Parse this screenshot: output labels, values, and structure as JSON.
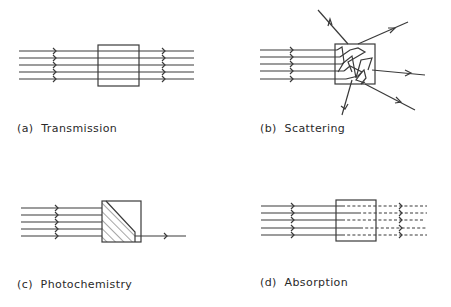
{
  "figure": {
    "panels": [
      {
        "id": "a",
        "label": "(a)  Transmission",
        "process": "Transmission",
        "rays_in": 5,
        "rays_out": 5,
        "output": "solid"
      },
      {
        "id": "b",
        "label": "(b)  Scattering",
        "process": "Scattering",
        "rays_in": 5,
        "rays_out": 5,
        "output": "scattered in multiple directions"
      },
      {
        "id": "c",
        "label": "(c)  Photochemistry",
        "process": "Photochemistry",
        "rays_in": 5,
        "rays_out": 1,
        "output": "hatched reactive region"
      },
      {
        "id": "d",
        "label": "(d)  Absorption",
        "process": "Absorption",
        "rays_in": 5,
        "rays_out": 5,
        "output": "dashed (attenuated)"
      }
    ],
    "colors": {
      "stroke": "#3a3a3a",
      "text": "#2a2a2a",
      "background": "#ffffff"
    }
  }
}
